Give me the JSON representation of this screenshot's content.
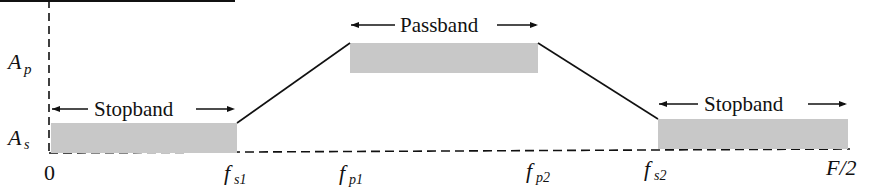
{
  "diagram": {
    "type": "bandpass-filter-specification",
    "colors": {
      "band_fill": "#c8c8c8",
      "line": "#111111",
      "background": "#ffffff"
    },
    "y_axis": {
      "labels": [
        {
          "id": "Ap",
          "main": "A",
          "sub": "p"
        },
        {
          "id": "As",
          "main": "A",
          "sub": "s"
        }
      ]
    },
    "x_axis": {
      "origin_label": "0",
      "ticks": [
        {
          "id": "fs1",
          "main": "f",
          "sub": "s1"
        },
        {
          "id": "fp1",
          "main": "f",
          "sub": "p1"
        },
        {
          "id": "fp2",
          "main": "f",
          "sub": "p2"
        },
        {
          "id": "fs2",
          "main": "f",
          "sub": "s2"
        }
      ],
      "end_label": "F/2"
    },
    "bands": [
      {
        "id": "stopband-left",
        "label": "Stopband",
        "range": "0 to fs1",
        "level": "As"
      },
      {
        "id": "passband",
        "label": "Passband",
        "range": "fp1 to fp2",
        "level": "Ap"
      },
      {
        "id": "stopband-right",
        "label": "Stopband",
        "range": "fs2 to F/2",
        "level": "As"
      }
    ],
    "arrows": {
      "left": "←",
      "right": "→"
    }
  }
}
